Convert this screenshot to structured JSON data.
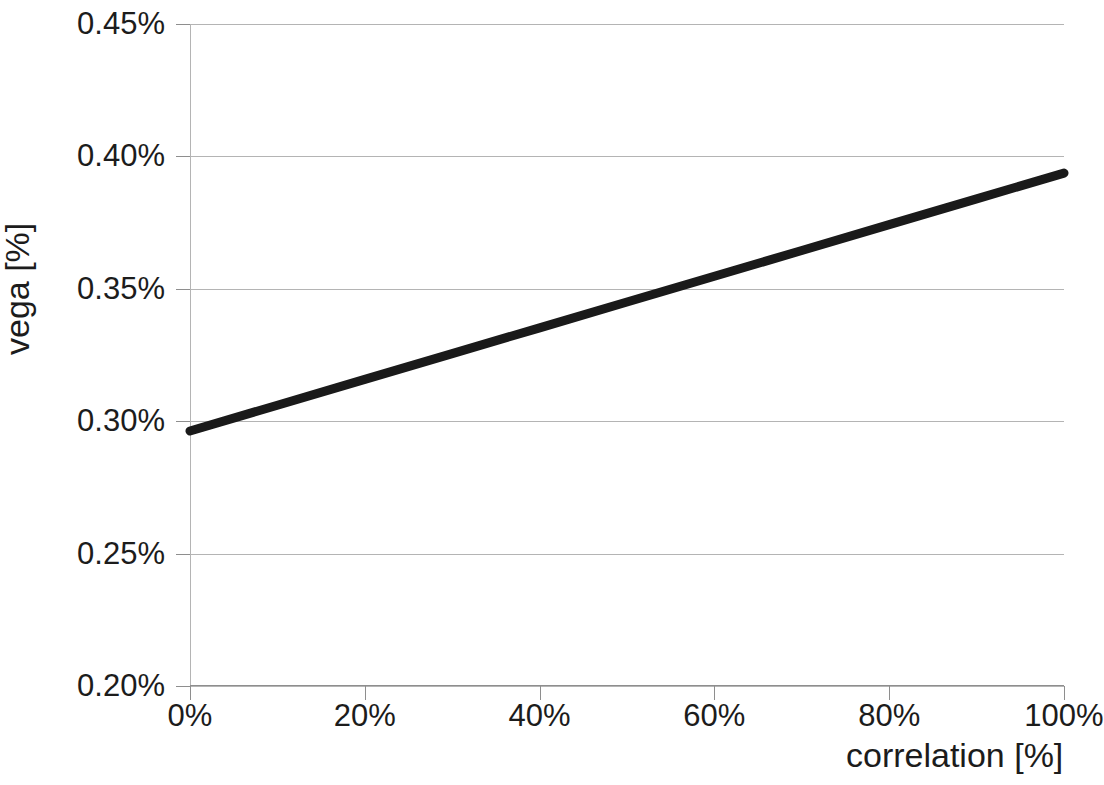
{
  "chart_data": {
    "type": "line",
    "title": "",
    "subtitle": "",
    "xlabel": "correlation [%]",
    "ylabel": "vega [%]",
    "xlim": [
      0,
      100
    ],
    "ylim": [
      0.2,
      0.45
    ],
    "grid": true,
    "legend": null,
    "x_tick_labels": [
      "0%",
      "20%",
      "40%",
      "60%",
      "80%",
      "100%"
    ],
    "x_tick_values": [
      0,
      20,
      40,
      60,
      80,
      100
    ],
    "y_tick_labels": [
      "0.20%",
      "0.25%",
      "0.30%",
      "0.35%",
      "0.40%",
      "0.45%"
    ],
    "y_tick_values": [
      0.2,
      0.25,
      0.3,
      0.35,
      0.4,
      0.45
    ],
    "series": [
      {
        "name": "vega",
        "color": "#1a1a1a",
        "line_width": 9,
        "x": [
          0,
          10,
          20,
          30,
          40,
          50,
          60,
          70,
          80,
          90,
          100
        ],
        "values": [
          0.2963,
          0.3102,
          0.3238,
          0.337,
          0.35,
          0.3626,
          0.3748,
          0.3866,
          0.3779,
          0.3905,
          0.3937
        ]
      }
    ]
  },
  "axes": {
    "y_title": "vega [%]",
    "x_title": "correlation [%]"
  }
}
